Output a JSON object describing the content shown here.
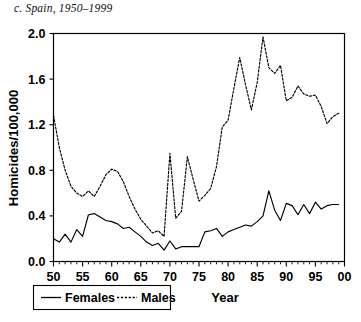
{
  "figure": {
    "panel_title": "c. Spain, 1950–1999"
  },
  "chart_data": {
    "type": "line",
    "title": "c. Spain, 1950–1999",
    "xlabel": "Year",
    "ylabel": "Homicides/100,000",
    "xlim": [
      1950,
      2000
    ],
    "ylim": [
      0.0,
      2.0
    ],
    "grid": false,
    "legend_position": "bottom-left",
    "y_ticks": [
      "0.0",
      "0.4",
      "0.8",
      "1.2",
      "1.6",
      "2.0"
    ],
    "y_tick_values": [
      0.0,
      0.4,
      0.8,
      1.2,
      1.6,
      2.0
    ],
    "x_ticks": [
      "50",
      "55",
      "60",
      "65",
      "70",
      "75",
      "80",
      "85",
      "90",
      "95",
      "00"
    ],
    "x_tick_values": [
      1950,
      1955,
      1960,
      1965,
      1970,
      1975,
      1980,
      1985,
      1990,
      1995,
      2000
    ],
    "x": [
      1950,
      1951,
      1952,
      1953,
      1954,
      1955,
      1956,
      1957,
      1958,
      1959,
      1960,
      1961,
      1962,
      1963,
      1964,
      1965,
      1966,
      1967,
      1968,
      1969,
      1970,
      1971,
      1972,
      1973,
      1974,
      1975,
      1976,
      1977,
      1978,
      1979,
      1980,
      1981,
      1982,
      1983,
      1984,
      1985,
      1986,
      1987,
      1988,
      1989,
      1990,
      1991,
      1992,
      1993,
      1994,
      1995,
      1996,
      1997,
      1998,
      1999
    ],
    "series": [
      {
        "name": "Females",
        "style": "solid",
        "color": "#000000",
        "values": [
          0.2,
          0.17,
          0.24,
          0.17,
          0.28,
          0.22,
          0.41,
          0.42,
          0.39,
          0.36,
          0.35,
          0.33,
          0.29,
          0.3,
          0.26,
          0.22,
          0.17,
          0.14,
          0.16,
          0.1,
          0.18,
          0.11,
          0.13,
          0.13,
          0.13,
          0.13,
          0.26,
          0.27,
          0.29,
          0.22,
          0.26,
          0.28,
          0.3,
          0.32,
          0.31,
          0.35,
          0.4,
          0.62,
          0.45,
          0.36,
          0.51,
          0.49,
          0.41,
          0.5,
          0.42,
          0.52,
          0.46,
          0.49,
          0.5,
          0.5
        ]
      },
      {
        "name": "Males",
        "style": "dashed",
        "color": "#000000",
        "values": [
          1.28,
          1.0,
          0.8,
          0.66,
          0.6,
          0.57,
          0.62,
          0.57,
          0.66,
          0.76,
          0.81,
          0.79,
          0.7,
          0.57,
          0.46,
          0.37,
          0.31,
          0.25,
          0.27,
          0.22,
          0.95,
          0.38,
          0.44,
          0.92,
          0.72,
          0.53,
          0.58,
          0.64,
          0.83,
          1.18,
          1.24,
          1.52,
          1.79,
          1.55,
          1.33,
          1.57,
          1.97,
          1.7,
          1.65,
          1.72,
          1.41,
          1.44,
          1.54,
          1.47,
          1.45,
          1.46,
          1.36,
          1.21,
          1.27,
          1.3
        ]
      }
    ]
  },
  "legend": {
    "entries": [
      {
        "label": "Females",
        "style": "solid"
      },
      {
        "label": "Males",
        "style": "dashed"
      }
    ]
  }
}
